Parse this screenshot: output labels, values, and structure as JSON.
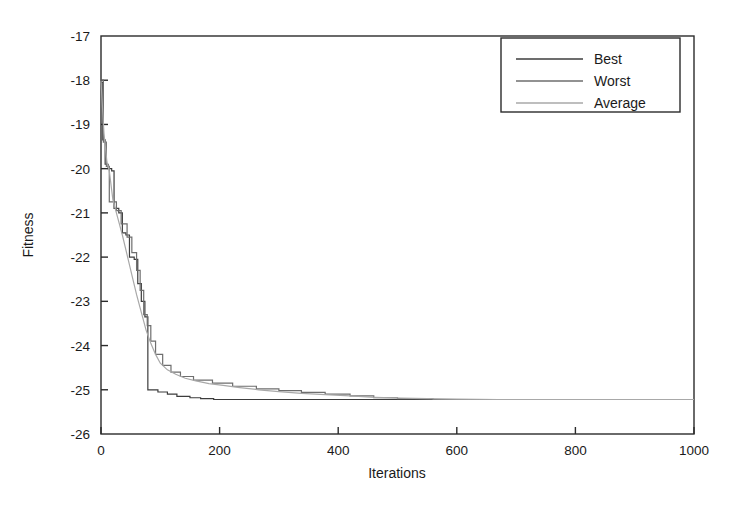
{
  "chart_data": {
    "type": "line",
    "title": "",
    "xlabel": "Iterations",
    "ylabel": "Fitness",
    "xlim": [
      0,
      1000
    ],
    "ylim": [
      -26,
      -17
    ],
    "xticks": [
      0,
      200,
      400,
      600,
      800,
      1000
    ],
    "xtick_labels": [
      "0",
      "200",
      "400",
      "600",
      "800",
      "1000"
    ],
    "yticks": [
      -26,
      -25,
      -24,
      -23,
      -22,
      -21,
      -20,
      -19,
      -18,
      -17
    ],
    "ytick_labels": [
      "-26",
      "-25",
      "-24",
      "-23",
      "-22",
      "-21",
      "-20",
      "-19",
      "-18",
      "-17"
    ],
    "grid": false,
    "legend_position": "top-right",
    "series": [
      {
        "name": "Best",
        "color": "#3c3c3c",
        "style": "staircase",
        "points": [
          [
            0,
            -18.05
          ],
          [
            3,
            -18.05
          ],
          [
            3,
            -19.35
          ],
          [
            7,
            -19.35
          ],
          [
            7,
            -19.9
          ],
          [
            12,
            -19.9
          ],
          [
            12,
            -20.0
          ],
          [
            18,
            -20.0
          ],
          [
            18,
            -20.05
          ],
          [
            22,
            -20.05
          ],
          [
            22,
            -20.9
          ],
          [
            30,
            -20.9
          ],
          [
            30,
            -21.0
          ],
          [
            36,
            -21.0
          ],
          [
            36,
            -21.45
          ],
          [
            42,
            -21.45
          ],
          [
            42,
            -21.5
          ],
          [
            48,
            -21.5
          ],
          [
            48,
            -22.0
          ],
          [
            56,
            -22.0
          ],
          [
            56,
            -22.05
          ],
          [
            62,
            -22.05
          ],
          [
            62,
            -22.6
          ],
          [
            68,
            -22.6
          ],
          [
            68,
            -23.0
          ],
          [
            74,
            -23.0
          ],
          [
            74,
            -23.35
          ],
          [
            79,
            -23.35
          ],
          [
            79,
            -25.0
          ],
          [
            96,
            -25.0
          ],
          [
            96,
            -25.05
          ],
          [
            112,
            -25.05
          ],
          [
            112,
            -25.1
          ],
          [
            128,
            -25.1
          ],
          [
            128,
            -25.15
          ],
          [
            150,
            -25.15
          ],
          [
            150,
            -25.18
          ],
          [
            168,
            -25.18
          ],
          [
            168,
            -25.2
          ],
          [
            190,
            -25.2
          ],
          [
            190,
            -25.22
          ],
          [
            1000,
            -25.22
          ]
        ]
      },
      {
        "name": "Worst",
        "color": "#6e6e6e",
        "style": "staircase",
        "points": [
          [
            0,
            -18.0
          ],
          [
            4,
            -18.0
          ],
          [
            4,
            -19.4
          ],
          [
            9,
            -19.4
          ],
          [
            9,
            -19.95
          ],
          [
            14,
            -19.95
          ],
          [
            14,
            -20.75
          ],
          [
            26,
            -20.75
          ],
          [
            26,
            -20.95
          ],
          [
            34,
            -20.95
          ],
          [
            34,
            -21.25
          ],
          [
            44,
            -21.25
          ],
          [
            44,
            -21.55
          ],
          [
            52,
            -21.55
          ],
          [
            52,
            -21.9
          ],
          [
            60,
            -21.9
          ],
          [
            60,
            -22.3
          ],
          [
            66,
            -22.3
          ],
          [
            66,
            -22.75
          ],
          [
            72,
            -22.75
          ],
          [
            72,
            -23.3
          ],
          [
            78,
            -23.3
          ],
          [
            78,
            -23.55
          ],
          [
            84,
            -23.55
          ],
          [
            84,
            -23.9
          ],
          [
            92,
            -23.9
          ],
          [
            92,
            -24.2
          ],
          [
            104,
            -24.2
          ],
          [
            104,
            -24.45
          ],
          [
            118,
            -24.45
          ],
          [
            118,
            -24.6
          ],
          [
            134,
            -24.6
          ],
          [
            134,
            -24.7
          ],
          [
            156,
            -24.7
          ],
          [
            156,
            -24.78
          ],
          [
            188,
            -24.78
          ],
          [
            188,
            -24.85
          ],
          [
            222,
            -24.85
          ],
          [
            222,
            -24.92
          ],
          [
            262,
            -24.92
          ],
          [
            262,
            -24.98
          ],
          [
            300,
            -24.98
          ],
          [
            300,
            -25.02
          ],
          [
            338,
            -25.02
          ],
          [
            338,
            -25.06
          ],
          [
            378,
            -25.06
          ],
          [
            378,
            -25.1
          ],
          [
            420,
            -25.1
          ],
          [
            420,
            -25.14
          ],
          [
            460,
            -25.14
          ],
          [
            460,
            -25.18
          ],
          [
            500,
            -25.18
          ],
          [
            500,
            -25.2
          ],
          [
            560,
            -25.2
          ],
          [
            560,
            -25.22
          ],
          [
            670,
            -25.22
          ],
          [
            1000,
            -25.22
          ]
        ]
      },
      {
        "name": "Average",
        "color": "#a8a8a8",
        "style": "smooth",
        "points": [
          [
            0,
            -18.02
          ],
          [
            5,
            -19.2
          ],
          [
            10,
            -19.85
          ],
          [
            14,
            -20.05
          ],
          [
            20,
            -20.7
          ],
          [
            28,
            -21.1
          ],
          [
            36,
            -21.5
          ],
          [
            44,
            -21.95
          ],
          [
            52,
            -22.4
          ],
          [
            60,
            -22.85
          ],
          [
            68,
            -23.25
          ],
          [
            76,
            -23.65
          ],
          [
            84,
            -23.95
          ],
          [
            92,
            -24.2
          ],
          [
            100,
            -24.4
          ],
          [
            112,
            -24.55
          ],
          [
            126,
            -24.65
          ],
          [
            142,
            -24.74
          ],
          [
            160,
            -24.8
          ],
          [
            182,
            -24.86
          ],
          [
            206,
            -24.9
          ],
          [
            234,
            -24.95
          ],
          [
            266,
            -25.0
          ],
          [
            300,
            -25.04
          ],
          [
            338,
            -25.08
          ],
          [
            378,
            -25.11
          ],
          [
            420,
            -25.14
          ],
          [
            462,
            -25.17
          ],
          [
            505,
            -25.19
          ],
          [
            550,
            -25.2
          ],
          [
            600,
            -25.21
          ],
          [
            670,
            -25.22
          ],
          [
            800,
            -25.22
          ],
          [
            1000,
            -25.22
          ]
        ]
      }
    ]
  },
  "legend": {
    "entries": [
      {
        "label": "Best"
      },
      {
        "label": "Worst"
      },
      {
        "label": "Average"
      }
    ]
  },
  "axes": {
    "x_title": "Iterations",
    "y_title": "Fitness"
  },
  "colors": {
    "axis": "#2b2b2b",
    "best": "#3c3c3c",
    "worst": "#6e6e6e",
    "average": "#a8a8a8",
    "background": "#ffffff"
  }
}
